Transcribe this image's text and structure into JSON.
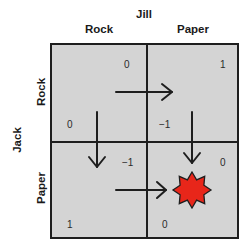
{
  "column_player": {
    "name": "Jill",
    "strategies": [
      "Rock",
      "Paper"
    ]
  },
  "row_player": {
    "name": "Jack",
    "strategies": [
      "Rock",
      "Paper"
    ]
  },
  "payoffs": {
    "rock_rock": {
      "jack": "0",
      "jill": "0"
    },
    "rock_paper": {
      "jack": "−1",
      "jill": "1"
    },
    "paper_rock": {
      "jack": "1",
      "jill": "−1"
    },
    "paper_paper": {
      "jack": "0",
      "jill": "0"
    }
  },
  "arrows": [
    {
      "from": "rock_rock",
      "to": "rock_paper",
      "direction": "right"
    },
    {
      "from": "paper_rock",
      "to": "paper_paper",
      "direction": "right"
    },
    {
      "from": "rock_rock",
      "to": "paper_rock",
      "direction": "down"
    },
    {
      "from": "rock_paper",
      "to": "paper_paper",
      "direction": "down"
    }
  ],
  "equilibrium": {
    "cell": "paper_paper",
    "marker": "star-burst",
    "color": "#e8261a"
  },
  "colors": {
    "cell_background": "#d4d4d4",
    "lines": "#1e1e1e"
  }
}
